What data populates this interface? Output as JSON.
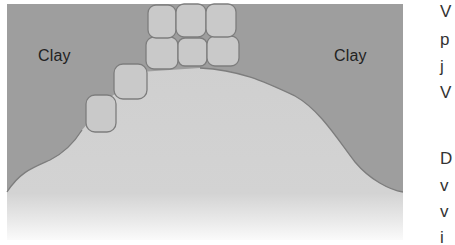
{
  "figure": {
    "labels": {
      "left": "Clay",
      "right": "Clay"
    },
    "colors": {
      "clay": "#9e9e9e",
      "soil_light": "#cfcfcf",
      "block_fill": "#c9c9c9",
      "line": "#7d7d7d",
      "background": "#ffffff"
    }
  },
  "side_text": {
    "lines": [
      "V",
      "p",
      "j",
      "V",
      "D",
      "v",
      "v",
      "i"
    ]
  }
}
